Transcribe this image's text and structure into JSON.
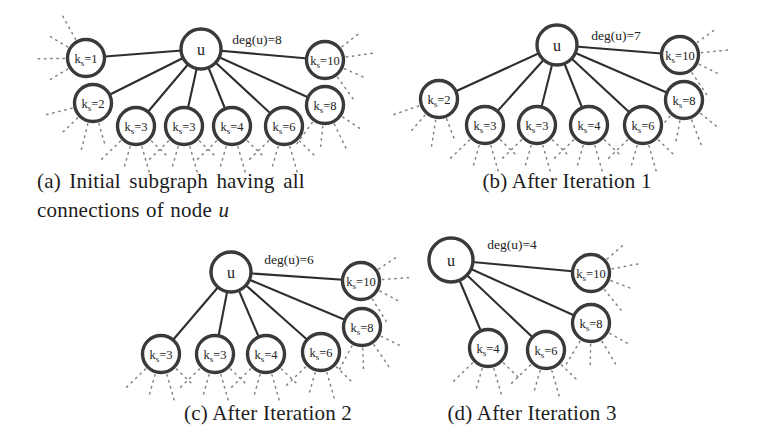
{
  "style": {
    "node_stroke": "#3a3a3a",
    "node_fill": "#ffffff",
    "edge_color": "#2e2e2e",
    "stub_color": "#828282",
    "text_color": "#222222"
  },
  "figures": [
    {
      "id": "a",
      "deg_label": "deg(u)=8",
      "deg_label_pos": {
        "x": 257,
        "y": 39
      },
      "u": {
        "label": "u",
        "x": 201,
        "y": 49,
        "r": 20
      },
      "nodes": [
        {
          "label": "k_s=1",
          "x": 86,
          "y": 58,
          "stub_dir": 195
        },
        {
          "label": "k_s=2",
          "x": 93,
          "y": 103,
          "stub_dir": 120
        },
        {
          "label": "k_s=3",
          "x": 136,
          "y": 126,
          "stub_dir": 90
        },
        {
          "label": "k_s=3",
          "x": 184,
          "y": 126,
          "stub_dir": 90
        },
        {
          "label": "k_s=4",
          "x": 232,
          "y": 126,
          "stub_dir": 90
        },
        {
          "label": "k_s=6",
          "x": 284,
          "y": 126,
          "stub_dir": 90
        },
        {
          "label": "k_s=8",
          "x": 325,
          "y": 105,
          "stub_dir": 80
        },
        {
          "label": "k_s=10",
          "x": 325,
          "y": 60,
          "stub_dir": 8
        }
      ],
      "caption_line1": "(a) Initial subgraph having all",
      "caption_line2_prefix": "connections of node ",
      "caption_line2_math": "u"
    },
    {
      "id": "b",
      "deg_label": "deg(u)=7",
      "deg_label_pos": {
        "x": 616,
        "y": 35
      },
      "u": {
        "label": "u",
        "x": 557,
        "y": 45,
        "r": 20
      },
      "nodes": [
        {
          "label": "k_s=2",
          "x": 439,
          "y": 99,
          "stub_dir": 115
        },
        {
          "label": "k_s=3",
          "x": 485,
          "y": 125,
          "stub_dir": 90
        },
        {
          "label": "k_s=3",
          "x": 537,
          "y": 125,
          "stub_dir": 90
        },
        {
          "label": "k_s=4",
          "x": 589,
          "y": 125,
          "stub_dir": 90
        },
        {
          "label": "k_s=6",
          "x": 643,
          "y": 125,
          "stub_dir": 90
        },
        {
          "label": "k_s=8",
          "x": 684,
          "y": 100,
          "stub_dir": 85
        },
        {
          "label": "k_s=10",
          "x": 680,
          "y": 55,
          "stub_dir": 10
        }
      ],
      "caption": "(b) After Iteration 1"
    },
    {
      "id": "c",
      "deg_label": "deg(u)=6",
      "deg_label_pos": {
        "x": 289,
        "y": 259
      },
      "u": {
        "label": "u",
        "x": 231,
        "y": 272,
        "r": 20
      },
      "nodes": [
        {
          "label": "k_s=3",
          "x": 161,
          "y": 354,
          "stub_dir": 90
        },
        {
          "label": "k_s=3",
          "x": 215,
          "y": 354,
          "stub_dir": 90
        },
        {
          "label": "k_s=4",
          "x": 266,
          "y": 354,
          "stub_dir": 90
        },
        {
          "label": "k_s=6",
          "x": 321,
          "y": 352,
          "stub_dir": 90
        },
        {
          "label": "k_s=8",
          "x": 362,
          "y": 327,
          "stub_dir": 72
        },
        {
          "label": "k_s=10",
          "x": 361,
          "y": 281,
          "stub_dir": 12
        }
      ],
      "caption": "(c) After Iteration 2"
    },
    {
      "id": "d",
      "deg_label": "deg(u)=4",
      "deg_label_pos": {
        "x": 512,
        "y": 244
      },
      "u": {
        "label": "u",
        "x": 451,
        "y": 260,
        "r": 22
      },
      "nodes": [
        {
          "label": "k_s=4",
          "x": 488,
          "y": 348,
          "stub_dir": 90
        },
        {
          "label": "k_s=6",
          "x": 546,
          "y": 350,
          "stub_dir": 90
        },
        {
          "label": "k_s=8",
          "x": 591,
          "y": 323,
          "stub_dir": 75
        },
        {
          "label": "k_s=10",
          "x": 591,
          "y": 273,
          "stub_dir": 5
        }
      ],
      "caption": "(d) After Iteration 3"
    }
  ]
}
